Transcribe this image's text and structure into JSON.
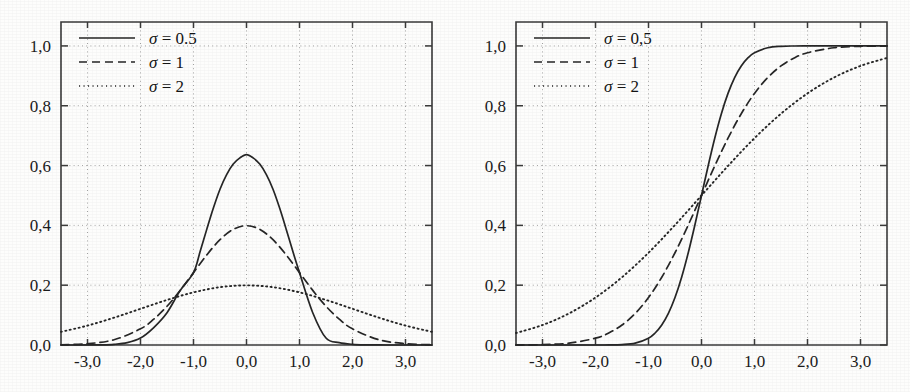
{
  "figure": {
    "title": "",
    "panel_count": 2,
    "background_color": "#fdfdfc",
    "ink_color": "#262626",
    "grid_color": "#9a9a9a"
  },
  "chart_data": [
    {
      "type": "line",
      "id": "gaussian-pdf",
      "title": "",
      "subtitle": "",
      "xlabel": "",
      "ylabel": "",
      "xlim": [
        -3.5,
        3.5
      ],
      "ylim": [
        0.0,
        1.08
      ],
      "xticks": [
        -3.0,
        -2.0,
        -1.0,
        0.0,
        1.0,
        2.0,
        3.0
      ],
      "xticklabels": [
        "-3,0",
        "-2,0",
        "-1,0",
        "0,0",
        "1,0",
        "2,0",
        "3,0"
      ],
      "yticks": [
        0.0,
        0.2,
        0.4,
        0.6,
        0.8,
        1.0
      ],
      "yticklabels": [
        "0,0",
        "0,2",
        "0,4",
        "0,6",
        "0,8",
        "1,0"
      ],
      "grid": true,
      "grid_style": "dotted",
      "legend_position": "upper-left",
      "function": "normal probability density, mean 0",
      "series": [
        {
          "name": "sigma-0.5",
          "legend_label": "σ = 0.5",
          "sigma": 0.5,
          "style": "solid",
          "peak_value": 0.798,
          "peak_x": 0.0,
          "x": [
            -3.5,
            -3.25,
            -3,
            -2.75,
            -2.5,
            -2.25,
            -2,
            -1.75,
            -1.5,
            -1.25,
            -1,
            -0.875,
            -0.75,
            -0.625,
            -0.5,
            -0.375,
            -0.25,
            -0.125,
            0,
            0.125,
            0.25,
            0.375,
            0.5,
            0.625,
            0.75,
            0.875,
            1,
            1.25,
            1.5,
            1.75,
            2,
            2.25,
            2.5,
            2.75,
            3,
            3.25,
            3.5
          ],
          "y": [
            0.0,
            0.0,
            0.0001,
            0.0005,
            0.0022,
            0.0079,
            0.0233,
            0.0584,
            0.108,
            0.1826,
            0.242,
            0.3123,
            0.3866,
            0.4578,
            0.5208,
            0.5697,
            0.6049,
            0.6255,
            0.6366,
            0.6255,
            0.6049,
            0.5697,
            0.5208,
            0.4578,
            0.3866,
            0.3123,
            0.242,
            0.108,
            0.0233,
            0.0079,
            0.0022,
            0.0005,
            0.0001,
            0.0,
            0.0,
            0.0,
            0.0
          ]
        },
        {
          "name": "sigma-1",
          "legend_label": "σ = 1",
          "sigma": 1,
          "style": "dashed",
          "peak_value": 0.399,
          "peak_x": 0.0,
          "x": [
            -3.5,
            -3,
            -2.5,
            -2,
            -1.75,
            -1.5,
            -1.25,
            -1,
            -0.75,
            -0.5,
            -0.25,
            0,
            0.25,
            0.5,
            0.75,
            1,
            1.25,
            1.5,
            1.75,
            2,
            2.5,
            3,
            3.5
          ],
          "y": [
            0.0009,
            0.0044,
            0.0175,
            0.054,
            0.0863,
            0.1295,
            0.1826,
            0.242,
            0.3011,
            0.3521,
            0.3867,
            0.3989,
            0.3867,
            0.3521,
            0.3011,
            0.242,
            0.1826,
            0.1295,
            0.0863,
            0.054,
            0.0175,
            0.0044,
            0.0009
          ]
        },
        {
          "name": "sigma-2",
          "legend_label": "σ = 2",
          "sigma": 2,
          "style": "dotted",
          "peak_value": 0.199,
          "peak_x": 0.0,
          "x": [
            -3.5,
            -3,
            -2.5,
            -2,
            -1.5,
            -1,
            -0.5,
            0,
            0.5,
            1,
            1.5,
            2,
            2.5,
            3,
            3.5
          ],
          "y": [
            0.044,
            0.0648,
            0.0913,
            0.121,
            0.1506,
            0.176,
            0.1933,
            0.1995,
            0.1933,
            0.176,
            0.1506,
            0.121,
            0.0913,
            0.0648,
            0.044
          ]
        }
      ]
    },
    {
      "type": "line",
      "id": "gaussian-cdf",
      "title": "",
      "subtitle": "",
      "xlabel": "",
      "ylabel": "",
      "xlim": [
        -3.5,
        3.5
      ],
      "ylim": [
        0.0,
        1.08
      ],
      "xticks": [
        -3.0,
        -2.0,
        -1.0,
        0.0,
        1.0,
        2.0,
        3.0
      ],
      "xticklabels": [
        "-3,0",
        "-2,0",
        "-1,0",
        "0,0",
        "1,0",
        "2,0",
        "3,0"
      ],
      "yticks": [
        0.0,
        0.2,
        0.4,
        0.6,
        0.8,
        1.0
      ],
      "yticklabels": [
        "0,0",
        "0,2",
        "0,4",
        "0,6",
        "0,8",
        "1,0"
      ],
      "grid": true,
      "grid_style": "dotted",
      "legend_position": "upper-left",
      "function": "normal cumulative distribution, mean 0",
      "series": [
        {
          "name": "sigma-0.5",
          "legend_label": "σ = 0,5",
          "sigma": 0.5,
          "style": "solid",
          "x": [
            -3.5,
            -3,
            -2.5,
            -2,
            -1.75,
            -1.5,
            -1.25,
            -1,
            -0.875,
            -0.75,
            -0.625,
            -0.5,
            -0.375,
            -0.25,
            -0.125,
            0,
            0.125,
            0.25,
            0.375,
            0.5,
            0.625,
            0.75,
            0.875,
            1,
            1.25,
            1.5,
            1.75,
            2,
            2.5,
            3,
            3.5
          ],
          "y": [
            0.0,
            0.0,
            0.0,
            0.0,
            0.0002,
            0.0013,
            0.0062,
            0.0228,
            0.0401,
            0.0668,
            0.1056,
            0.1587,
            0.2266,
            0.3085,
            0.4013,
            0.5,
            0.5987,
            0.6915,
            0.7734,
            0.8413,
            0.8944,
            0.9332,
            0.9599,
            0.9772,
            0.9938,
            0.9987,
            0.9998,
            1.0,
            1.0,
            1.0,
            1.0
          ]
        },
        {
          "name": "sigma-1",
          "legend_label": "σ = 1",
          "sigma": 1,
          "style": "dashed",
          "x": [
            -3.5,
            -3,
            -2.5,
            -2,
            -1.75,
            -1.5,
            -1.25,
            -1,
            -0.75,
            -0.5,
            -0.25,
            0,
            0.25,
            0.5,
            0.75,
            1,
            1.25,
            1.5,
            1.75,
            2,
            2.5,
            3,
            3.5
          ],
          "y": [
            0.0002,
            0.0013,
            0.0062,
            0.0228,
            0.0401,
            0.0668,
            0.1056,
            0.1587,
            0.2266,
            0.3085,
            0.4013,
            0.5,
            0.5987,
            0.6915,
            0.7734,
            0.8413,
            0.8944,
            0.9332,
            0.9599,
            0.9772,
            0.9938,
            0.9987,
            0.9998
          ]
        },
        {
          "name": "sigma-2",
          "legend_label": "σ = 2",
          "sigma": 2,
          "style": "dotted",
          "x": [
            -3.5,
            -3,
            -2.5,
            -2,
            -1.5,
            -1,
            -0.5,
            0,
            0.5,
            1,
            1.5,
            2,
            2.5,
            3,
            3.5
          ],
          "y": [
            0.0401,
            0.0668,
            0.1056,
            0.1587,
            0.2266,
            0.3085,
            0.4013,
            0.5,
            0.5987,
            0.6915,
            0.7734,
            0.8413,
            0.8944,
            0.9332,
            0.9599
          ]
        }
      ]
    }
  ]
}
